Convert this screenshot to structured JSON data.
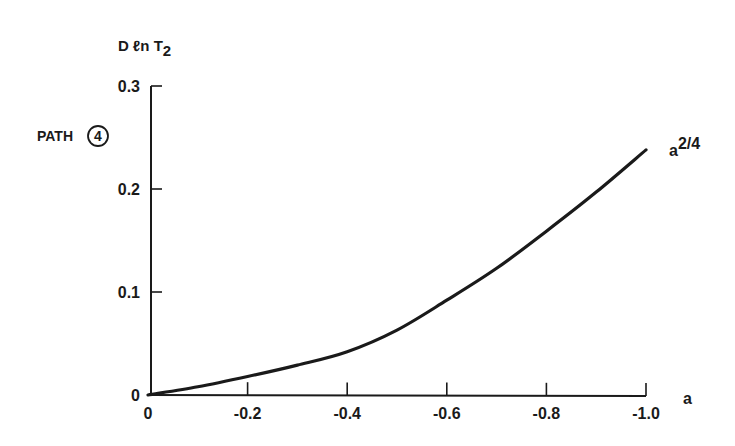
{
  "chart_data": {
    "type": "line",
    "title": "",
    "ylabel": "D ℓn T2",
    "ylabel_parts": {
      "main": "D ℓn T",
      "sub": "2"
    },
    "xlabel": "a",
    "side_label": {
      "text": "PATH",
      "circled": "4"
    },
    "xlim": [
      0,
      -1.0
    ],
    "ylim": [
      0,
      0.3
    ],
    "x_ticks": [
      0,
      -0.2,
      -0.4,
      -0.6,
      -0.8,
      -1.0
    ],
    "x_tick_labels": [
      "0",
      "-0.2",
      "-0.4",
      "-0.6",
      "-0.8",
      "-1.0"
    ],
    "y_ticks": [
      0,
      0.1,
      0.2,
      0.3
    ],
    "y_tick_labels": [
      "0",
      "0.1",
      "0.2",
      "0.3"
    ],
    "grid": false,
    "series": [
      {
        "name": "a²/4",
        "label_parts": {
          "base": "a",
          "sup": "2/4"
        },
        "x": [
          0,
          -0.1,
          -0.2,
          -0.3,
          -0.4,
          -0.5,
          -0.6,
          -0.7,
          -0.8,
          -0.9,
          -1.0
        ],
        "y": [
          0,
          0.008,
          0.018,
          0.029,
          0.042,
          0.063,
          0.092,
          0.123,
          0.159,
          0.197,
          0.238
        ]
      }
    ],
    "colors": {
      "line": "#1a1a1a",
      "axis": "#1a1a1a",
      "background": "#ffffff"
    }
  }
}
